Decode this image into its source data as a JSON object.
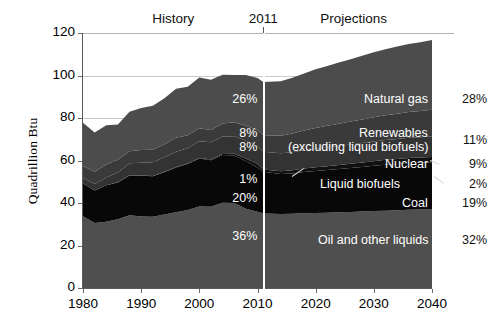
{
  "header": {
    "history_label": "History",
    "year_marker": "2011",
    "projections_label": "Projections"
  },
  "axes": {
    "ylabel": "Quadrillion Btu",
    "yticks": [
      "0",
      "20",
      "40",
      "60",
      "80",
      "100",
      "120"
    ],
    "xticks": [
      "1980",
      "1990",
      "2000",
      "2010",
      "2020",
      "2030",
      "2040"
    ],
    "ylim": [
      0,
      120
    ],
    "xlim": [
      1980,
      2040
    ]
  },
  "series_labels": {
    "natural_gas": "Natural gas",
    "renewables": "Renewables",
    "renewables_note": "(excluding liquid biofuels)",
    "nuclear": "Nuclear",
    "liquid_biofuels": "Liquid biofuels",
    "coal": "Coal",
    "oil": "Oil and other liquids"
  },
  "share_2011": {
    "natural_gas": "26%",
    "renewables": "8%",
    "nuclear": "8%",
    "liquid_biofuels": "1%",
    "coal": "20%",
    "oil": "36%"
  },
  "share_2040": {
    "natural_gas": "28%",
    "renewables": "11%",
    "nuclear": "9%",
    "liquid_biofuels": "2%",
    "coal": "19%",
    "oil": "32%"
  },
  "colors": {
    "natural_gas": "#4c4c4c",
    "renewables": "#3a3a3a",
    "nuclear": "#333333",
    "liquid_biofuels": "#111111",
    "coal": "#080808",
    "oil": "#4f4f4f",
    "gridline": "#c9c9c9",
    "divider": "#ffffff",
    "background": "#ffffff"
  },
  "chart_data": {
    "type": "area",
    "title": "",
    "xlabel": "",
    "ylabel": "Quadrillion Btu",
    "xlim": [
      1980,
      2040
    ],
    "ylim": [
      0,
      120
    ],
    "grid": true,
    "legend_position": "inline-annotations",
    "stacked": true,
    "units": "quadrillion Btu",
    "history_end_year": 2011,
    "annotations": [
      {
        "text": "History",
        "x": 1993
      },
      {
        "text": "2011",
        "x": 2011
      },
      {
        "text": "Projections",
        "x": 2026
      }
    ],
    "x": [
      1980,
      1982,
      1984,
      1986,
      1988,
      1990,
      1992,
      1994,
      1996,
      1998,
      2000,
      2002,
      2004,
      2006,
      2008,
      2010,
      2011,
      2014,
      2016,
      2018,
      2020,
      2022,
      2024,
      2026,
      2028,
      2030,
      2032,
      2034,
      2036,
      2038,
      2040
    ],
    "series": [
      {
        "name": "Oil and other liquids",
        "stack_order": 1,
        "color": "#4f4f4f",
        "share_2011": 36,
        "share_2040": 32,
        "values": [
          33.8,
          30.6,
          31.2,
          32.4,
          34.2,
          33.6,
          33.5,
          34.6,
          35.7,
          36.7,
          38.3,
          38.2,
          40.1,
          40.0,
          37.3,
          35.9,
          35.1,
          34.8,
          34.9,
          35.2,
          35.3,
          35.4,
          35.6,
          35.8,
          36.0,
          36.2,
          36.4,
          36.6,
          36.8,
          36.9,
          37.0
        ]
      },
      {
        "name": "Coal",
        "stack_order": 2,
        "color": "#080808",
        "share_2011": 20,
        "share_2040": 19,
        "values": [
          15.4,
          15.3,
          17.1,
          17.3,
          18.8,
          19.2,
          19.1,
          19.9,
          21.0,
          21.7,
          22.6,
          21.9,
          22.5,
          22.4,
          22.4,
          20.8,
          19.6,
          18.8,
          19.0,
          19.4,
          19.8,
          20.1,
          20.4,
          20.7,
          21.0,
          21.3,
          21.6,
          21.8,
          22.0,
          22.1,
          22.2
        ]
      },
      {
        "name": "Liquid biofuels",
        "stack_order": 3,
        "color": "#111111",
        "share_2011": 1,
        "share_2040": 2,
        "values": [
          0.0,
          0.0,
          0.1,
          0.1,
          0.1,
          0.1,
          0.1,
          0.2,
          0.2,
          0.2,
          0.3,
          0.4,
          0.5,
          0.8,
          1.2,
          1.6,
          1.1,
          1.4,
          1.5,
          1.6,
          1.7,
          1.8,
          1.9,
          2.0,
          2.1,
          2.2,
          2.3,
          2.3,
          2.4,
          2.4,
          2.5
        ]
      },
      {
        "name": "Nuclear",
        "stack_order": 4,
        "color": "#333333",
        "share_2011": 8,
        "share_2040": 9,
        "values": [
          2.7,
          3.1,
          3.6,
          4.5,
          5.6,
          6.1,
          6.5,
          6.8,
          7.2,
          7.2,
          7.9,
          8.1,
          8.2,
          8.2,
          8.4,
          8.4,
          8.3,
          8.4,
          8.5,
          8.6,
          8.7,
          8.8,
          8.9,
          9.0,
          9.1,
          9.2,
          9.3,
          9.4,
          9.5,
          9.6,
          9.7
        ]
      },
      {
        "name": "Renewables (excluding liquid biofuels)",
        "stack_order": 5,
        "color": "#3a3a3a",
        "share_2011": 8,
        "share_2040": 11,
        "values": [
          5.5,
          5.7,
          6.1,
          6.0,
          5.6,
          6.0,
          5.9,
          6.1,
          6.6,
          6.1,
          6.1,
          5.8,
          6.1,
          6.6,
          7.1,
          7.5,
          7.8,
          8.3,
          8.8,
          9.3,
          9.8,
          10.2,
          10.5,
          10.8,
          11.1,
          11.4,
          11.7,
          11.9,
          12.1,
          12.3,
          12.5
        ]
      },
      {
        "name": "Natural gas",
        "stack_order": 6,
        "color": "#4c4c4c",
        "share_2011": 26,
        "share_2040": 28,
        "values": [
          20.4,
          18.5,
          18.5,
          16.7,
          18.6,
          19.7,
          20.7,
          21.7,
          23.1,
          22.8,
          23.9,
          23.6,
          23.0,
          22.2,
          23.8,
          24.6,
          25.0,
          25.6,
          26.2,
          26.9,
          27.6,
          28.2,
          28.8,
          29.4,
          30.0,
          30.6,
          31.1,
          31.6,
          32.0,
          32.4,
          32.8
        ]
      }
    ],
    "totals": [
      77.8,
      73.2,
      76.6,
      77.0,
      82.9,
      84.7,
      85.8,
      89.3,
      93.8,
      94.7,
      99.1,
      98.0,
      100.4,
      100.2,
      100.2,
      98.8,
      96.9,
      97.3,
      98.9,
      101.0,
      102.9,
      104.5,
      106.1,
      107.7,
      109.3,
      110.9,
      112.4,
      113.6,
      114.8,
      115.7,
      116.7
    ]
  }
}
